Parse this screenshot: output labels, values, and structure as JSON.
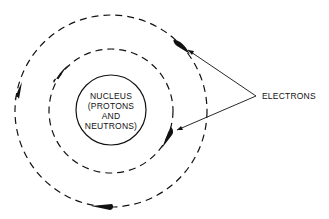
{
  "diagram": {
    "type": "atom-model",
    "nucleus": {
      "lines": [
        "NUCLEUS",
        "(PROTONS",
        "AND",
        "NEUTRONS)"
      ]
    },
    "callout_label": "ELECTRONS",
    "orbits": [
      {
        "name": "inner-orbit",
        "style": "dashed"
      },
      {
        "name": "outer-orbit",
        "style": "dashed"
      }
    ],
    "electrons_count": 5,
    "colors": {
      "stroke": "#111111",
      "background": "#ffffff"
    }
  }
}
